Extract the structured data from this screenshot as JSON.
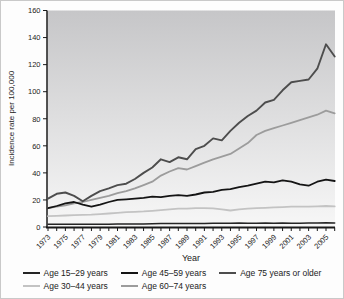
{
  "figure": {
    "y_axis_title": "Incidence rate per 100,000",
    "x_axis_title": "Year"
  },
  "chart_data": {
    "type": "line",
    "title": "",
    "xlabel": "Year",
    "ylabel": "Incidence rate per 100,000",
    "x_start": 1973,
    "x_end": 2006,
    "ylim": [
      0,
      160
    ],
    "y_ticks": [
      0,
      20,
      40,
      60,
      80,
      100,
      120,
      140,
      160
    ],
    "x_tick_labels": [
      "1973",
      "1975",
      "1977",
      "1979",
      "1981",
      "1983",
      "1985",
      "1987",
      "1989",
      "1991",
      "1993",
      "1995",
      "1997",
      "1999",
      "2001",
      "2003",
      "2005"
    ],
    "grid": false,
    "legend_position": "bottom",
    "plot_bg_gradient": {
      "top": "#c6c6c8",
      "bottom": "#f7f7f7"
    },
    "axis_color": "#1a1a1a",
    "tick_label_color": "#222222",
    "series": [
      {
        "name": "Age 15–29 years",
        "color": "#252525",
        "width": 1.5,
        "values": [
          2,
          2,
          2,
          2,
          2,
          2,
          2.1,
          2.1,
          2.2,
          2.2,
          2.3,
          2.3,
          2.4,
          2.5,
          2.5,
          2.5,
          2.5,
          2.6,
          2.6,
          2.7,
          2.7,
          2.8,
          3,
          2.8,
          2.8,
          2.9,
          2.8,
          2.9,
          2.8,
          2.8,
          2.9,
          3,
          3.2,
          3
        ]
      },
      {
        "name": "Age 30–44 years",
        "color": "#c3c3c3",
        "width": 1.8,
        "values": [
          8,
          8.2,
          8.5,
          8.8,
          9,
          9.2,
          9.5,
          10,
          10.5,
          11,
          11.2,
          11.5,
          12,
          12.5,
          13,
          13.5,
          13.5,
          14,
          14,
          13.8,
          13,
          12.2,
          13,
          13.5,
          14,
          14.2,
          14.5,
          14.7,
          15,
          15,
          15,
          15.2,
          15.5,
          15.2
        ]
      },
      {
        "name": "Age 45–59 years",
        "color": "#141414",
        "width": 1.8,
        "values": [
          14,
          15.5,
          17.5,
          18.5,
          16.5,
          15,
          16.5,
          18.5,
          20,
          20.5,
          21,
          21.5,
          22.5,
          22,
          23,
          23.5,
          23,
          24,
          25.5,
          26,
          27.5,
          28,
          29.5,
          30.5,
          32,
          33.5,
          33,
          34.5,
          33.5,
          31.5,
          30.5,
          33.5,
          35,
          34
        ]
      },
      {
        "name": "Age 60–74 years",
        "color": "#9c9c9c",
        "width": 1.8,
        "values": [
          14,
          15,
          16,
          17.5,
          18.5,
          20,
          21.5,
          23,
          25,
          26.5,
          28.5,
          31,
          33.5,
          38,
          41,
          43.5,
          42.5,
          45,
          47.5,
          50,
          52,
          54,
          58,
          62,
          68,
          71,
          73,
          75,
          77,
          79,
          81,
          83,
          86,
          84
        ]
      },
      {
        "name": "Age 75 years or older",
        "color": "#4d4d4d",
        "width": 1.9,
        "values": [
          21,
          24.5,
          25.5,
          23,
          19,
          23,
          26.5,
          28.5,
          31,
          32,
          35.5,
          40,
          44,
          50,
          48,
          51.5,
          50,
          57.5,
          60,
          65.5,
          64,
          71,
          77,
          82,
          86,
          92,
          94,
          101,
          107,
          108,
          109,
          117,
          135,
          126
        ]
      }
    ]
  }
}
